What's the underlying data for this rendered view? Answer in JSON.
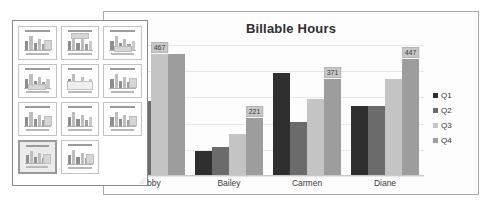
{
  "chart_data": {
    "type": "bar",
    "title": "Billable Hours",
    "xlabel": "",
    "ylabel": "",
    "grid": true,
    "legend_position": "right",
    "ylim": [
      0,
      500
    ],
    "categories": [
      "Abby",
      "Bailey",
      "Carmen",
      "Diane"
    ],
    "series": [
      {
        "name": "Q1",
        "color": "#2f2f2f",
        "values": [
          352,
          96,
          392,
          268
        ]
      },
      {
        "name": "Q2",
        "color": "#6b6b6b",
        "values": [
          286,
          110,
          205,
          268
        ]
      },
      {
        "name": "Q3",
        "color": "#c4c4c4",
        "values": [
          467,
          160,
          295,
          372
        ]
      },
      {
        "name": "Q4",
        "color": "#9d9d9d",
        "values": [
          467,
          221,
          371,
          447
        ]
      }
    ],
    "data_labels": [
      {
        "category": "Abby",
        "series": "Q3",
        "value": "467"
      },
      {
        "category": "Bailey",
        "series": "Q4",
        "value": "221"
      },
      {
        "category": "Carmen",
        "series": "Q4",
        "value": "371"
      },
      {
        "category": "Diane",
        "series": "Q4",
        "value": "447"
      }
    ],
    "gridline_count": 5
  },
  "chart_panel": {
    "name": "chart-slide"
  },
  "legend": {
    "items": [
      {
        "label": "Q1",
        "color": "#2f2f2f"
      },
      {
        "label": "Q2",
        "color": "#6b6b6b"
      },
      {
        "label": "Q3",
        "color": "#c4c4c4"
      },
      {
        "label": "Q4",
        "color": "#9d9d9d"
      }
    ]
  },
  "gallery": {
    "name": "chart-layouts-gallery",
    "selected_index": 9,
    "thumbnails": [
      {
        "id": "layout-1",
        "variant": "legend-right"
      },
      {
        "id": "layout-2",
        "variant": "legend-top"
      },
      {
        "id": "layout-3",
        "variant": "legend-bottom"
      },
      {
        "id": "layout-4",
        "variant": "legend-bottom"
      },
      {
        "id": "layout-5",
        "variant": "data-table"
      },
      {
        "id": "layout-6",
        "variant": "legend-right"
      },
      {
        "id": "layout-7",
        "variant": "legend-right"
      },
      {
        "id": "layout-8",
        "variant": "plain"
      },
      {
        "id": "layout-9",
        "variant": "legend-right"
      },
      {
        "id": "layout-10",
        "variant": "legend-right"
      },
      {
        "id": "layout-11",
        "variant": "legend-right"
      }
    ],
    "resize_grip": "resize-grip-icon"
  }
}
